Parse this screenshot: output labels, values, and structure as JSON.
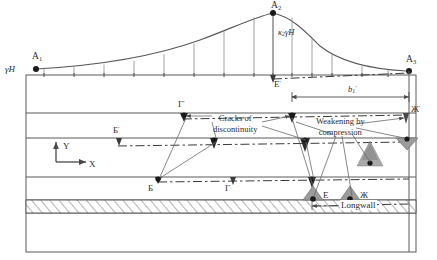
{
  "figure": {
    "type": "geomechanical-cross-section-diagram"
  },
  "load_curve": {
    "left_endpoint_label": "A",
    "left_endpoint_sub": "1",
    "peak_label": "A",
    "peak_sub": "2",
    "right_endpoint_label": "A",
    "right_endpoint_sub": "3",
    "left_stress_label": "γH",
    "peak_stress_label_k": "κ",
    "peak_stress_label_k_sub": "2",
    "peak_stress_label_rest": "γH"
  },
  "dimension": {
    "label_main": "b",
    "label_sub": "1",
    "label_prime": "′"
  },
  "axes": {
    "y_label": "Y",
    "x_label": "X"
  },
  "annotations": [
    {
      "id": "cracks",
      "line1": "Cracks of",
      "line2": "discontinuity"
    },
    {
      "id": "weakening",
      "line1": "Weakening by",
      "line2": "compression"
    },
    {
      "id": "longwall",
      "line1": "Longwall"
    }
  ],
  "point_labels": [
    {
      "id": "E-prime",
      "base": "E",
      "prime": "′"
    },
    {
      "id": "G-prime",
      "base": "Г",
      "prime": "′"
    },
    {
      "id": "B-prime",
      "base": "Б",
      "prime": "′"
    },
    {
      "id": "Zh-prime",
      "base": "Ж",
      "prime": "′"
    },
    {
      "id": "B",
      "base": "Б",
      "prime": ""
    },
    {
      "id": "G",
      "base": "Г",
      "prime": ""
    },
    {
      "id": "E",
      "base": "Е",
      "prime": ""
    },
    {
      "id": "Zh",
      "base": "Ж",
      "prime": ""
    }
  ],
  "colors": {
    "stroke": "#4a4a4a",
    "text": "#2b2b2b",
    "hatch_fill": "#ffffff",
    "crack_fill": "#9b9b9b",
    "dash": "#3a3a3a"
  },
  "strata": {
    "boundaries_y": [
      75,
      113,
      138,
      177,
      200,
      213,
      252
    ],
    "hatched_layer": {
      "top": 200,
      "bottom": 213
    }
  }
}
